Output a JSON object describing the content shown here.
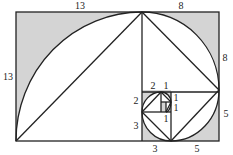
{
  "diagram": {
    "type": "golden-spiral-fibonacci-rectangles",
    "colors": {
      "shade": "#d4d4d4",
      "line": "#222222",
      "background": "#ffffff"
    },
    "labels": {
      "top_13": "13",
      "top_8": "8",
      "left_13": "13",
      "right_8": "8",
      "right_5": "5",
      "bottom_3": "3",
      "bottom_5": "5",
      "inner_2_top": "2",
      "inner_1_top": "1",
      "inner_2_left": "2",
      "inner_3_left": "3",
      "inner_1_right_a": "1",
      "inner_1_right_b": "1",
      "inner_1_bottom": "1"
    },
    "squares": [
      13,
      8,
      5,
      3,
      2,
      1,
      1
    ]
  }
}
